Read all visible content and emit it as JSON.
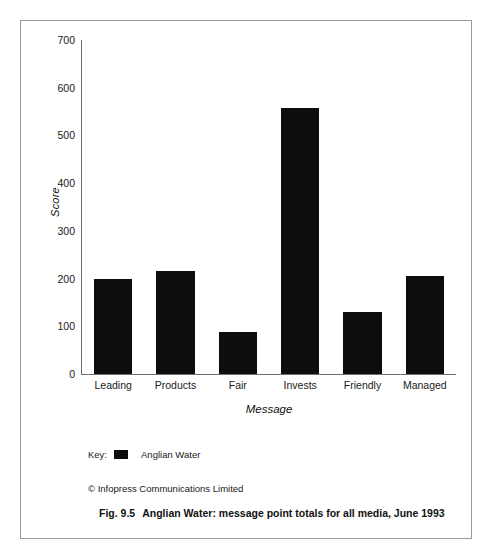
{
  "figure": {
    "caption_number": "Fig. 9.5",
    "caption_text": "Anglian Water: message point totals for all media, June 1993",
    "copyright": "© Infopress Communications Limited"
  },
  "legend": {
    "key_label": "Key:",
    "series_label": "Anglian Water",
    "swatch_color": "#0d0d0d",
    "swatch_icon": "filled-square-icon"
  },
  "chart_data": {
    "type": "bar",
    "title": "",
    "categories": [
      "Leading",
      "Products",
      "Fair",
      "Invests",
      "Friendly",
      "Managed"
    ],
    "values": [
      200,
      215,
      88,
      558,
      130,
      205
    ],
    "series": [
      {
        "name": "Anglian Water",
        "color": "#0d0d0d",
        "values": [
          200,
          215,
          88,
          558,
          130,
          205
        ]
      }
    ],
    "xlabel": "Message",
    "ylabel": "Score",
    "ylim": [
      0,
      700
    ],
    "yticks": [
      0,
      100,
      200,
      300,
      400,
      500,
      600,
      700
    ],
    "ytick_labels": [
      "0",
      "100",
      "200",
      "300",
      "400",
      "500",
      "600",
      "700"
    ],
    "grid": false,
    "legend_position": "below-plot"
  }
}
